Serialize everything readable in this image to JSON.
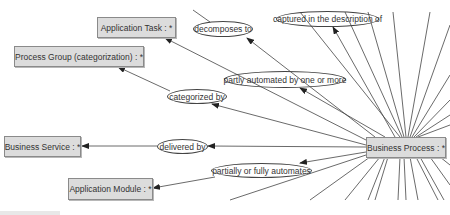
{
  "diagram": {
    "nodes": [
      {
        "id": "application-task",
        "label": "Application Task : *",
        "x": 97,
        "y": 17,
        "w": 79,
        "h": 21
      },
      {
        "id": "process-group",
        "label": "Process Group (categorization) : *",
        "x": 14,
        "y": 46,
        "w": 130,
        "h": 21
      },
      {
        "id": "business-service",
        "label": "Business Service : *",
        "x": 4,
        "y": 136,
        "w": 77,
        "h": 21
      },
      {
        "id": "application-module",
        "label": "Application Module : *",
        "x": 68,
        "y": 178,
        "w": 85,
        "h": 22
      },
      {
        "id": "business-process",
        "label": "Business Process : *",
        "x": 366,
        "y": 137,
        "w": 80,
        "h": 21
      }
    ],
    "edge_labels": [
      {
        "id": "decomposes-to",
        "label": "decomposes to",
        "x": 193,
        "y": 21,
        "w": 60,
        "h": 16
      },
      {
        "id": "captured-in-description",
        "label": "captured in the description of",
        "x": 276,
        "y": 11,
        "w": 103,
        "h": 16
      },
      {
        "id": "partly-automated",
        "label": "partly automated by one or more",
        "x": 224,
        "y": 71,
        "w": 122,
        "h": 17
      },
      {
        "id": "categorized-by",
        "label": "categorized by",
        "x": 167,
        "y": 89,
        "w": 60,
        "h": 15
      },
      {
        "id": "delivered-by",
        "label": "delivered by",
        "x": 157,
        "y": 139,
        "w": 51,
        "h": 15
      },
      {
        "id": "partially-or-fully-automates",
        "label": "partially or fully automates",
        "x": 211,
        "y": 163,
        "w": 101,
        "h": 15
      }
    ],
    "colors": {
      "node_fill": "#dcdcdc",
      "node_border": "#8a8a8a",
      "edge": "#333333"
    }
  }
}
